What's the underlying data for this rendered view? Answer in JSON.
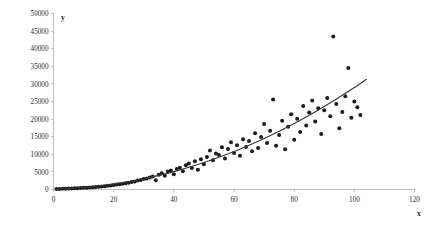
{
  "chart_data": {
    "type": "scatter",
    "title": "",
    "subtitle": "",
    "xlabel": "x",
    "ylabel": "y",
    "xlim": [
      0,
      120
    ],
    "ylim": [
      0,
      50000
    ],
    "grid": false,
    "legend": null,
    "x_ticks": [
      0,
      20,
      40,
      60,
      80,
      100,
      120
    ],
    "x_tick_labels": [
      "0",
      "20",
      "40",
      "60",
      "80",
      "100",
      "120"
    ],
    "y_ticks": [
      0,
      5000,
      10000,
      15000,
      20000,
      25000,
      30000,
      35000,
      40000,
      45000,
      50000
    ],
    "y_tick_labels": [
      "0",
      "5000",
      "10000",
      "15000",
      "20000",
      "25000",
      "30000",
      "35000",
      "40000",
      "45000",
      "50000"
    ],
    "marker": "filled-circle",
    "marker_color": "#1c1c1c",
    "marker_size": 2.0,
    "trend": {
      "name": "fitted curve",
      "color": "#3a3a3a",
      "type": "power",
      "x_range": [
        1,
        104
      ],
      "points": [
        [
          1,
          60
        ],
        [
          5,
          230
        ],
        [
          10,
          560
        ],
        [
          15,
          1000
        ],
        [
          20,
          1560
        ],
        [
          25,
          2240
        ],
        [
          30,
          3050
        ],
        [
          35,
          4000
        ],
        [
          40,
          5080
        ],
        [
          45,
          6300
        ],
        [
          50,
          7660
        ],
        [
          55,
          9160
        ],
        [
          60,
          10800
        ],
        [
          65,
          12580
        ],
        [
          70,
          14500
        ],
        [
          75,
          16560
        ],
        [
          80,
          18760
        ],
        [
          85,
          21100
        ],
        [
          90,
          23600
        ],
        [
          95,
          26200
        ],
        [
          100,
          28950
        ],
        [
          104,
          31300
        ]
      ]
    },
    "points": [
      [
        1,
        120
      ],
      [
        2,
        150
      ],
      [
        3,
        180
      ],
      [
        4,
        220
      ],
      [
        5,
        260
      ],
      [
        6,
        300
      ],
      [
        7,
        340
      ],
      [
        8,
        380
      ],
      [
        9,
        430
      ],
      [
        10,
        480
      ],
      [
        11,
        530
      ],
      [
        12,
        600
      ],
      [
        13,
        650
      ],
      [
        14,
        720
      ],
      [
        15,
        800
      ],
      [
        16,
        880
      ],
      [
        17,
        950
      ],
      [
        18,
        1050
      ],
      [
        19,
        1150
      ],
      [
        20,
        1250
      ],
      [
        21,
        1400
      ],
      [
        22,
        1500
      ],
      [
        23,
        1650
      ],
      [
        24,
        1800
      ],
      [
        25,
        1950
      ],
      [
        26,
        2150
      ],
      [
        27,
        2300
      ],
      [
        28,
        2550
      ],
      [
        29,
        2700
      ],
      [
        30,
        2950
      ],
      [
        31,
        3150
      ],
      [
        32,
        3400
      ],
      [
        33,
        3700
      ],
      [
        34,
        2600
      ],
      [
        35,
        4200
      ],
      [
        36,
        4600
      ],
      [
        37,
        3900
      ],
      [
        38,
        5100
      ],
      [
        39,
        5400
      ],
      [
        40,
        4300
      ],
      [
        41,
        5800
      ],
      [
        42,
        6200
      ],
      [
        43,
        5200
      ],
      [
        44,
        6900
      ],
      [
        45,
        7400
      ],
      [
        46,
        6100
      ],
      [
        47,
        8000
      ],
      [
        48,
        5600
      ],
      [
        49,
        8600
      ],
      [
        50,
        7200
      ],
      [
        51,
        9200
      ],
      [
        52,
        11100
      ],
      [
        53,
        8300
      ],
      [
        54,
        10200
      ],
      [
        55,
        9800
      ],
      [
        56,
        12000
      ],
      [
        57,
        8800
      ],
      [
        58,
        11500
      ],
      [
        59,
        13400
      ],
      [
        60,
        10400
      ],
      [
        61,
        12600
      ],
      [
        62,
        9600
      ],
      [
        63,
        14300
      ],
      [
        64,
        12100
      ],
      [
        65,
        13800
      ],
      [
        66,
        10900
      ],
      [
        67,
        16000
      ],
      [
        68,
        11800
      ],
      [
        69,
        14900
      ],
      [
        70,
        18600
      ],
      [
        71,
        13200
      ],
      [
        72,
        16700
      ],
      [
        73,
        25600
      ],
      [
        74,
        12400
      ],
      [
        75,
        15500
      ],
      [
        76,
        19500
      ],
      [
        77,
        11400
      ],
      [
        78,
        17800
      ],
      [
        79,
        21400
      ],
      [
        80,
        14100
      ],
      [
        81,
        20100
      ],
      [
        82,
        16300
      ],
      [
        83,
        23700
      ],
      [
        84,
        18200
      ],
      [
        85,
        21900
      ],
      [
        86,
        25300
      ],
      [
        87,
        19300
      ],
      [
        88,
        23100
      ],
      [
        89,
        15800
      ],
      [
        90,
        22500
      ],
      [
        91,
        26000
      ],
      [
        92,
        20800
      ],
      [
        93,
        43500
      ],
      [
        94,
        24300
      ],
      [
        95,
        17400
      ],
      [
        96,
        22000
      ],
      [
        97,
        26500
      ],
      [
        98,
        34500
      ],
      [
        99,
        20400
      ],
      [
        100,
        25000
      ],
      [
        101,
        23400
      ],
      [
        102,
        21200
      ]
    ],
    "outliers": [
      {
        "x": 93,
        "y": 43500
      },
      {
        "x": 98,
        "y": 34500
      }
    ]
  }
}
